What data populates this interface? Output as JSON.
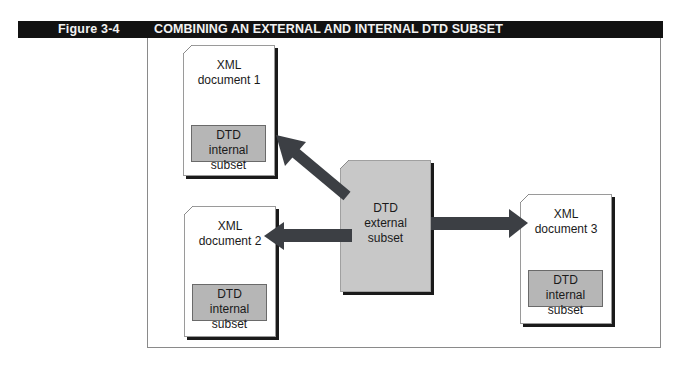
{
  "header": {
    "figure_label": "Figure 3-4",
    "title": "COMBINING AN EXTERNAL AND INTERNAL DTD SUBSET"
  },
  "diagram": {
    "documents": [
      {
        "line1": "XML",
        "line2": "document 1",
        "subset_line1": "DTD",
        "subset_line2": "internal subset"
      },
      {
        "line1": "XML",
        "line2": "document 2",
        "subset_line1": "DTD",
        "subset_line2": "internal subset"
      },
      {
        "line1": "XML",
        "line2": "document 3",
        "subset_line1": "DTD",
        "subset_line2": "internal subset"
      }
    ],
    "external": {
      "line1": "DTD",
      "line2": "external",
      "line3": "subset"
    },
    "arrows": [
      {
        "from": "DTD external subset",
        "to": "XML document 1"
      },
      {
        "from": "DTD external subset",
        "to": "XML document 2"
      },
      {
        "from": "DTD external subset",
        "to": "XML document 3"
      }
    ],
    "colors": {
      "header_bg": "#121212",
      "arrow": "#3c3f44",
      "external_fill": "#c8c8c8",
      "subset_fill": "#b6b6b6"
    }
  }
}
